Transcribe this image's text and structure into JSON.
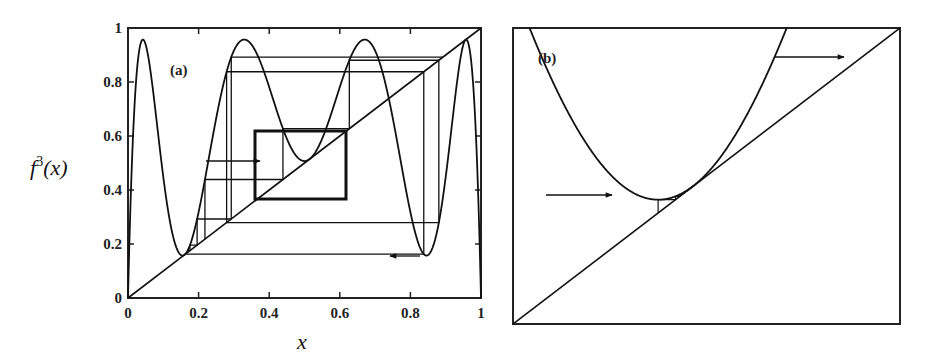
{
  "figure": {
    "panel_a_label": "(a)",
    "panel_b_label": "(b)",
    "xlabel": "x",
    "ylabel_main": "f",
    "ylabel_sup": "3",
    "ylabel_arg": "(x)"
  },
  "chart_data": [
    {
      "type": "line",
      "panel": "(a)",
      "title": "",
      "xlabel": "x",
      "ylabel": "f^3(x)",
      "xlim": [
        0,
        1
      ],
      "ylim": [
        0,
        1
      ],
      "x_ticks": [
        "0",
        "0.2",
        "0.4",
        "0.6",
        "0.8",
        "1"
      ],
      "y_ticks": [
        "0",
        "0.2",
        "0.4",
        "0.6",
        "0.8",
        "1"
      ],
      "grid": false,
      "series": [
        {
          "name": "f^3(x) third iterate of logistic map (r ≈ 3.8284)",
          "style": "curve"
        },
        {
          "name": "diagonal y = x",
          "style": "line",
          "x": [
            0,
            1
          ],
          "y": [
            0,
            1
          ]
        },
        {
          "name": "cobweb orbit",
          "style": "staircase with arrows"
        }
      ],
      "annotations": [
        {
          "type": "rectangle",
          "x": [
            0.36,
            0.62
          ],
          "y": [
            0.37,
            0.62
          ],
          "note": "zoom region shown in (b)"
        },
        {
          "type": "arrow",
          "from": [
            0.22,
            0.51
          ],
          "to": [
            0.49,
            0.51
          ],
          "direction": "right"
        },
        {
          "type": "arrow",
          "from": [
            0.85,
            0.15
          ],
          "to": [
            0.76,
            0.15
          ],
          "direction": "left"
        }
      ],
      "curve_extrema": {
        "maxima_x": [
          0.04,
          0.32,
          0.67,
          0.96
        ],
        "maxima_y": [
          0.96,
          0.96,
          0.96,
          0.96
        ],
        "minima_x": [
          0.16,
          0.51,
          0.85
        ],
        "minima_y": [
          0.16,
          0.51,
          0.15
        ]
      }
    },
    {
      "type": "line",
      "panel": "(b)",
      "title": "",
      "note": "enlargement of the boxed region in (a) near the tangency of f^3 with the diagonal",
      "grid": false,
      "series": [
        {
          "name": "f^3(x) (zoomed)",
          "style": "curve"
        },
        {
          "name": "diagonal y = x",
          "style": "line"
        },
        {
          "name": "cobweb orbit through narrow channel",
          "style": "staircase with arrows"
        }
      ],
      "annotations": [
        {
          "type": "arrow",
          "direction": "right",
          "position": "lower-left, entering channel"
        },
        {
          "type": "arrow",
          "direction": "right",
          "position": "upper-right, leaving channel"
        }
      ]
    }
  ]
}
